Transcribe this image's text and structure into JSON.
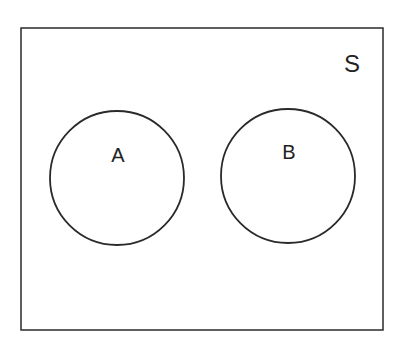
{
  "diagram": {
    "type": "venn",
    "universe": {
      "label": "S",
      "x": 21,
      "y": 28,
      "width": 362,
      "height": 302
    },
    "sets": [
      {
        "label": "A",
        "cx": 117,
        "cy": 178,
        "r": 67
      },
      {
        "label": "B",
        "cx": 288,
        "cy": 176,
        "r": 67
      }
    ],
    "relationship": "disjoint",
    "colors": {
      "stroke": "#2a2a2a",
      "background": "#ffffff"
    }
  }
}
